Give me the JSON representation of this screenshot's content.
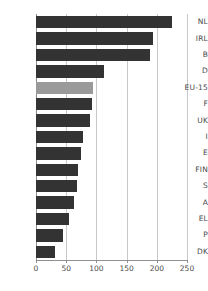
{
  "chart_data": {
    "type": "bar",
    "orientation": "horizontal",
    "title": "",
    "subtitle": "",
    "xlabel": "",
    "ylabel": "",
    "categories": [
      "NL",
      "IRL",
      "B",
      "D",
      "EU-15",
      "F",
      "UK",
      "I",
      "E",
      "FIN",
      "S",
      "A",
      "EL",
      "P",
      "DK"
    ],
    "values": [
      225,
      193,
      189,
      113,
      95,
      92,
      89,
      78,
      74,
      69,
      68,
      63,
      55,
      45,
      31
    ],
    "xlim": [
      0,
      250
    ],
    "xticks": [
      0,
      50,
      100,
      150,
      200,
      250
    ],
    "xtick_labels": [
      "0",
      "50",
      "100",
      "150",
      "200",
      "250"
    ],
    "grid": true,
    "grid_axis": "x",
    "legend": false,
    "legend_position": "none",
    "highlight_category": "EU-15",
    "colors": {
      "bar": "#333333",
      "bar_highlight": "#9a9a9a",
      "gridline": "#c9c9c9",
      "axis": "#8f8f8f",
      "tick_text": "#4a4a4a",
      "background": "#ffffff"
    }
  }
}
